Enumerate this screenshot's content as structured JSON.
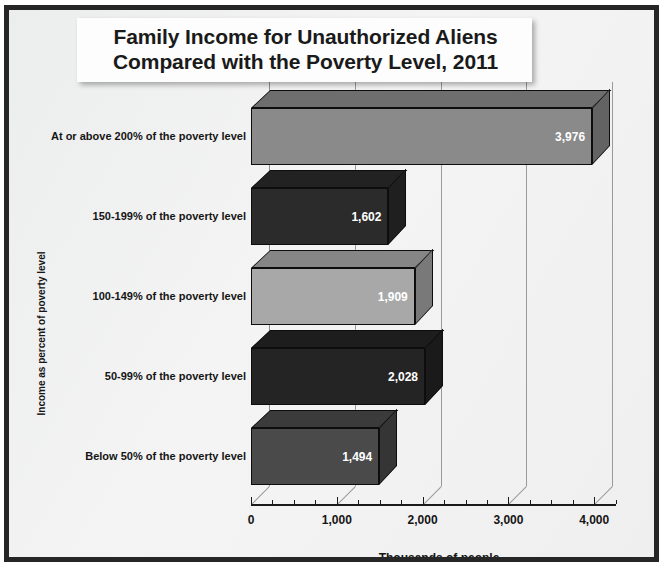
{
  "chart_data": {
    "type": "bar",
    "orientation": "horizontal",
    "title": "Family Income for Unauthorized Aliens Compared with the Poverty Level, 2011",
    "title_line1": "Family Income for Unauthorized Aliens",
    "title_line2": "Compared with the Poverty Level, 2011",
    "xlabel": "Thousands of people",
    "ylabel": "Income as percent of poverty level",
    "categories": [
      "At or above 200% of the poverty level",
      "150-199% of the poverty level",
      "100-149% of the poverty level",
      "50-99% of the poverty level",
      "Below 50% of the poverty level"
    ],
    "values": [
      3976,
      1602,
      1909,
      2028,
      1494
    ],
    "value_labels": [
      "3,976",
      "1,602",
      "1,909",
      "2,028",
      "1,494"
    ],
    "bar_colors": [
      "#8a8a8a",
      "#2b2b2b",
      "#a8a8a8",
      "#242424",
      "#4a4a4a"
    ],
    "xlim": [
      0,
      4250
    ],
    "xticks": [
      0,
      1000,
      2000,
      3000,
      4000
    ],
    "xtick_labels": [
      "0",
      "1,000",
      "2,000",
      "3,000",
      "4,000"
    ],
    "xtick_minor_step": 250,
    "grid": true,
    "grid_axis": "x",
    "legend": "none",
    "style_3d": true
  },
  "theme": {
    "frame_border": "#262626",
    "background": "#f2f2f2",
    "title_box_bg": "#fdfdfd",
    "text": "#151515",
    "value_text": "#ffffff",
    "grid_color": "#9a9a9a",
    "axis_color": "#1a1a1a"
  }
}
